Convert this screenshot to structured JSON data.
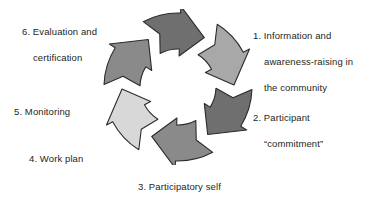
{
  "diagram": {
    "type": "cyclic-process",
    "background_color": "#ffffff",
    "text_color": "#231f20",
    "outline_color": "#2b2b2b",
    "direction": "clockwise",
    "step_count": 6,
    "center": {
      "x": 178,
      "y": 87
    },
    "outer_radius": 74,
    "inner_radius": 38,
    "steps": [
      {
        "number": "1.",
        "label_line_1": "1. Information and",
        "label_line_2": "awareness-raising in",
        "label_line_3": "the community",
        "full_text": "1. Information and awareness-raising in the community",
        "segment_fill": "#a8a8a8",
        "position": "right-upper"
      },
      {
        "number": "2.",
        "label_line_1": "2. Participant",
        "label_line_2": "“commitment”",
        "full_text": "2. Participant “commitment”",
        "segment_fill": "#6f6f6f",
        "position": "right-lower"
      },
      {
        "number": "3.",
        "label_line_1": "3. Participatory self",
        "label_line_2": "diagnosis",
        "full_text": "3. Participatory self diagnosis",
        "segment_fill": "#8a8a8a",
        "position": "bottom"
      },
      {
        "number": "4.",
        "label_line_1": "4. Work plan",
        "full_text": "4. Work plan",
        "segment_fill": "#d8d8d8",
        "position": "bottom-left"
      },
      {
        "number": "5.",
        "label_line_1": "5. Monitoring",
        "full_text": "5. Monitoring",
        "segment_fill": "#8a8a8a",
        "position": "left"
      },
      {
        "number": "6.",
        "label_line_1": "6. Evaluation and",
        "label_line_2": "certification",
        "full_text": "6. Evaluation and certification",
        "segment_fill": "#d8d8d8",
        "position": "top-left"
      }
    ],
    "extra_segment": {
      "note": "top segment",
      "segment_fill": "#6f6f6f"
    }
  }
}
